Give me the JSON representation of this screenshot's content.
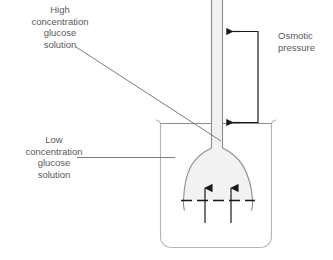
{
  "diagram": {
    "labels": {
      "high_concentration": "High\nconcentration\nglucose\nsolution",
      "low_concentration": "Low\nconcentration\nglucose\nsolution",
      "osmotic_pressure": "Osmotic\npressure"
    },
    "parts": {
      "capillary_tube": "capillary-tube",
      "funnel_bulb": "funnel-bulb",
      "beaker": "beaker",
      "membrane": "semipermeable-membrane",
      "water_flow_arrow_left": "water-flow-arrow-left",
      "water_flow_arrow_right": "water-flow-arrow-right",
      "pressure_arrow_top": "osmotic-pressure-arrow-top",
      "pressure_arrow_bottom": "osmotic-pressure-arrow-bottom",
      "pressure_bracket": "osmotic-pressure-bracket",
      "leader_high": "leader-line-high-concentration",
      "leader_low": "leader-line-low-concentration"
    },
    "colors": {
      "outline": "#8c8c8c",
      "solution_fill": "#f2f2f2",
      "text": "#58595b",
      "arrow_dark": "#1a1a1a",
      "background": "#ffffff"
    }
  }
}
